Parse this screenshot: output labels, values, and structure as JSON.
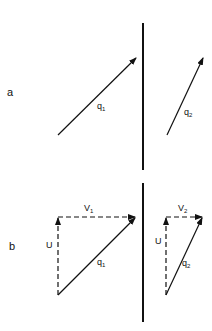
{
  "figure": {
    "width": 212,
    "height": 331,
    "stroke_color": "#111111",
    "background": "#ffffff",
    "boundary": {
      "x": 143,
      "segments": [
        {
          "y1": 23,
          "y2": 170
        },
        {
          "y1": 183,
          "y2": 322
        }
      ]
    },
    "panel_a": {
      "label": "a",
      "label_pos": {
        "x": 7,
        "y": 96
      },
      "vectors": [
        {
          "name": "q1",
          "from": {
            "x": 58,
            "y": 135
          },
          "to": {
            "x": 136,
            "y": 58
          },
          "style": "solid"
        },
        {
          "name": "q2",
          "from": {
            "x": 167,
            "y": 135
          },
          "to": {
            "x": 203,
            "y": 58
          },
          "style": "solid"
        }
      ],
      "labels": [
        {
          "text": "q",
          "sub": "1",
          "x": 97,
          "y": 109
        },
        {
          "text": "q",
          "sub": "2",
          "x": 184,
          "y": 115
        }
      ]
    },
    "panel_b": {
      "label": "b",
      "label_pos": {
        "x": 9,
        "y": 250
      },
      "vectors": [
        {
          "name": "U-left",
          "from": {
            "x": 58,
            "y": 295
          },
          "to": {
            "x": 58,
            "y": 218
          },
          "style": "dashed"
        },
        {
          "name": "V1",
          "from": {
            "x": 58,
            "y": 217
          },
          "to": {
            "x": 135,
            "y": 217
          },
          "style": "dashed"
        },
        {
          "name": "q1",
          "from": {
            "x": 58,
            "y": 295
          },
          "to": {
            "x": 135,
            "y": 218
          },
          "style": "solid"
        },
        {
          "name": "U-right",
          "from": {
            "x": 166,
            "y": 295
          },
          "to": {
            "x": 166,
            "y": 218
          },
          "style": "dashed"
        },
        {
          "name": "V2",
          "from": {
            "x": 166,
            "y": 217
          },
          "to": {
            "x": 202,
            "y": 217
          },
          "style": "dashed"
        },
        {
          "name": "q2",
          "from": {
            "x": 166,
            "y": 295
          },
          "to": {
            "x": 202,
            "y": 218
          },
          "style": "solid"
        }
      ],
      "labels": [
        {
          "text": "V",
          "sub": "1",
          "x": 84,
          "y": 211
        },
        {
          "text": "U",
          "sub": "",
          "x": 46,
          "y": 248
        },
        {
          "text": "q",
          "sub": "1",
          "x": 97,
          "y": 265
        },
        {
          "text": "V",
          "sub": "2",
          "x": 178,
          "y": 211
        },
        {
          "text": "U",
          "sub": "",
          "x": 155,
          "y": 244
        },
        {
          "text": "q",
          "sub": "2",
          "x": 182,
          "y": 266
        }
      ]
    }
  }
}
